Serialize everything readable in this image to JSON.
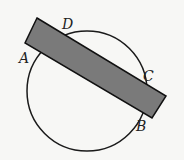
{
  "diagram": {
    "labels": {
      "A": "A",
      "B": "B",
      "C": "C",
      "D": "D"
    },
    "circle": {
      "cx": 87,
      "cy": 91,
      "r": 60,
      "stroke": "#1a1a1a"
    },
    "rectangle": {
      "fill": "#7a7a7a",
      "stroke": "#111111",
      "points": "37,18 166,96 152,118 25,43"
    }
  }
}
